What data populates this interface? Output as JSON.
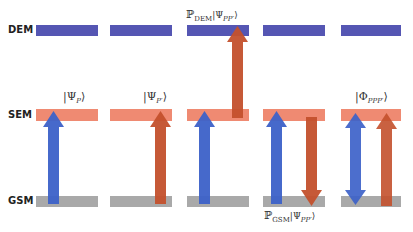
{
  "levels": {
    "dem": {
      "label": "DEM",
      "color": "#5556b3"
    },
    "sem": {
      "label": "SEM",
      "color": "#ef8a72"
    },
    "gsm": {
      "label": "GSM",
      "color": "#a9a9a9"
    }
  },
  "colors": {
    "blue_arrow": "#3d62c9",
    "red_arrow": "#c4512d"
  },
  "columns": [
    {
      "x": 36,
      "width": 62,
      "state_label": "|Ψ",
      "state_sub": "P",
      "state_close": "⟩"
    },
    {
      "x": 110,
      "width": 62,
      "state_label": "|Ψ",
      "state_sub": "P′",
      "state_close": "⟩"
    },
    {
      "x": 187,
      "width": 62,
      "top_label_prefix": "ℙ",
      "top_label_sub": "DEM",
      "top_label_state": "|Ψ",
      "top_label_state_sub": "PP′",
      "top_label_close": "⟩"
    },
    {
      "x": 263,
      "width": 62,
      "bottom_label_prefix": "ℙ",
      "bottom_label_sub": "GSM",
      "bottom_label_state": "|Ψ",
      "bottom_label_state_sub": "PP′",
      "bottom_label_close": "⟩"
    },
    {
      "x": 341,
      "width": 60,
      "state_label": "|Φ",
      "state_sub": "PPP′",
      "state_close": "⟩"
    }
  ]
}
